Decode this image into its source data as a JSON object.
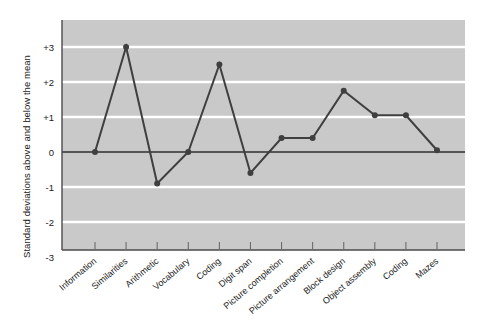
{
  "chart_data": {
    "type": "line",
    "title": "",
    "xlabel": "",
    "ylabel": "Standard deviations above and below the mean",
    "categories": [
      "Information",
      "Similarities",
      "Arithmetic",
      "Vocabulary",
      "Coding",
      "Digit span",
      "Picture completion",
      "Picture arrangement",
      "Block design",
      "Object assembly",
      "Coding",
      "Mazes"
    ],
    "values": [
      0,
      3,
      -0.9,
      0,
      2.5,
      -0.6,
      0.4,
      0.4,
      1.75,
      1.05,
      1.05,
      0.05
    ],
    "ylim": [
      -3,
      3
    ],
    "ytick_labels": [
      "+3",
      "+2",
      "+1",
      "0",
      "-1",
      "-2",
      "-3"
    ],
    "ytick_values": [
      3,
      2,
      1,
      0,
      -1,
      -2,
      -3
    ],
    "grid": true,
    "legend": "none",
    "series": [
      {
        "name": "Subtest profile",
        "values": [
          0,
          3,
          -0.9,
          0,
          2.5,
          -0.6,
          0.4,
          0.4,
          1.75,
          1.05,
          1.05,
          0.05
        ]
      }
    ],
    "colors": {
      "plot_background": "#c9c9c9",
      "gridline": "#ffffff",
      "line": "#3f3f3f",
      "marker": "#3f3f3f",
      "zero_line": "#555555",
      "axis": "#4a4a4a",
      "text": "#1a1a1a",
      "page_background": "#ffffff"
    }
  }
}
